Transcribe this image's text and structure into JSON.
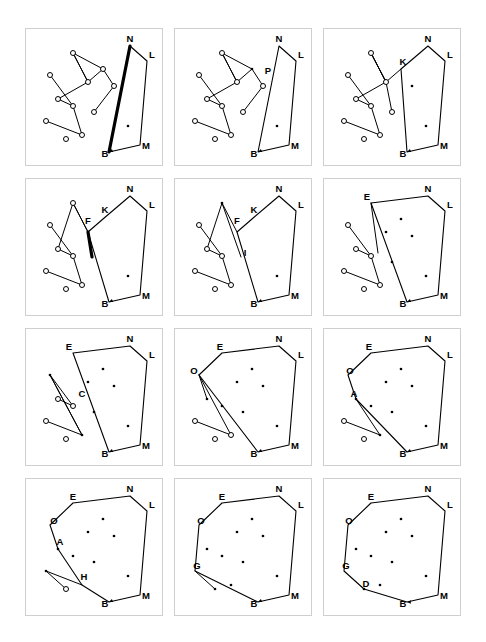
{
  "figure": {
    "panel_count": 12,
    "columns": 3,
    "rows": 4,
    "colors": {
      "stroke": "#000000",
      "panel_border": "#cfcfcf",
      "background": "#ffffff",
      "open_point_fill": "#ffffff",
      "closed_point_fill": "#000000"
    },
    "legend": {
      "open_circle_meaning": "unprocessed point",
      "filled_dot_meaning": "processed / interior point"
    }
  },
  "geometry": {
    "viewbox": "0 0 138 138",
    "hull_vertices_final": [
      {
        "label": "E",
        "x": 47,
        "y": 24
      },
      {
        "label": "N",
        "x": 104,
        "y": 17
      },
      {
        "label": "L",
        "x": 121,
        "y": 32
      },
      {
        "label": "M",
        "x": 114,
        "y": 116
      },
      {
        "label": "B",
        "x": 83,
        "y": 123
      },
      {
        "label": "D",
        "x": 40,
        "y": 110
      },
      {
        "label": "G",
        "x": 20,
        "y": 92
      },
      {
        "label": "O",
        "x": 24,
        "y": 46
      }
    ],
    "interior_points": [
      {
        "label": "I1",
        "x": 77,
        "y": 40
      },
      {
        "label": "I2",
        "x": 62,
        "y": 53
      },
      {
        "label": "I3",
        "x": 88,
        "y": 57
      },
      {
        "label": "I4",
        "x": 32,
        "y": 70
      },
      {
        "label": "I5",
        "x": 47,
        "y": 77
      },
      {
        "label": "I6",
        "x": 68,
        "y": 83
      },
      {
        "label": "I7",
        "x": 102,
        "y": 97
      },
      {
        "label": "I8",
        "x": 56,
        "y": 106
      }
    ],
    "scatter_points": [
      {
        "label": "p1",
        "x": 47,
        "y": 24
      },
      {
        "label": "p2",
        "x": 24,
        "y": 46
      },
      {
        "label": "p3",
        "x": 20,
        "y": 92
      },
      {
        "label": "p4",
        "x": 40,
        "y": 110
      },
      {
        "label": "p5",
        "x": 32,
        "y": 70
      },
      {
        "label": "p6",
        "x": 62,
        "y": 53
      },
      {
        "label": "p7",
        "x": 47,
        "y": 77
      },
      {
        "label": "p8",
        "x": 56,
        "y": 106
      },
      {
        "label": "p9",
        "x": 77,
        "y": 40
      },
      {
        "label": "p10",
        "x": 88,
        "y": 57
      },
      {
        "label": "p11",
        "x": 68,
        "y": 83
      },
      {
        "label": "p12",
        "x": 102,
        "y": 97
      },
      {
        "label": "p13",
        "x": 104,
        "y": 17
      },
      {
        "label": "p14",
        "x": 121,
        "y": 32
      },
      {
        "label": "p15",
        "x": 114,
        "y": 116
      },
      {
        "label": "p16",
        "x": 83,
        "y": 123
      }
    ]
  },
  "panels": [
    {
      "index": 1,
      "name": "step-1",
      "labels": [
        {
          "text": "N",
          "x": 104,
          "y": 13
        },
        {
          "text": "L",
          "x": 126,
          "y": 29
        },
        {
          "text": "M",
          "x": 120,
          "y": 120
        },
        {
          "text": "B",
          "x": 79,
          "y": 128
        }
      ],
      "hull_path": "M 83,123 L 104,17 L 121,32 L 114,116 Z",
      "hull_closed": true,
      "zigzag": "M 32,70 L 62,53 L 47,24 L 77,40 L 62,53",
      "chains": [
        "M 20,92 L 56,106 L 47,77",
        "M 24,46 L 47,77 L 32,70",
        "M 47,24 L 62,53",
        "M 77,40 L 88,57",
        "M 88,57 L 68,83"
      ],
      "open_points": [
        "p2",
        "p3",
        "p4",
        "p5",
        "p6",
        "p7",
        "p8",
        "p9",
        "p10",
        "p11",
        "p1"
      ],
      "closed_points": [
        "p12"
      ],
      "arrow_from": {
        "x": 90,
        "y": 120
      },
      "arrow_to": {
        "x": 83,
        "y": 123
      },
      "thick_edges": [
        "M 83,123 L 104,17"
      ]
    },
    {
      "index": 2,
      "name": "step-2",
      "labels": [
        {
          "text": "N",
          "x": 104,
          "y": 13
        },
        {
          "text": "L",
          "x": 126,
          "y": 29
        },
        {
          "text": "P",
          "x": 93,
          "y": 45
        },
        {
          "text": "M",
          "x": 120,
          "y": 120
        },
        {
          "text": "B",
          "x": 79,
          "y": 128
        }
      ],
      "hull_path": "M 83,123 L 104,17 L 121,32 L 114,116 Z",
      "hull_closed": true,
      "zigzag": "M 32,70 L 62,53 L 47,24 L 77,40 L 62,53",
      "chains": [
        "M 20,92 L 56,106 L 47,77",
        "M 24,46 L 47,77 L 32,70",
        "M 47,24 L 62,53",
        "M 77,40 L 88,57",
        "M 88,57 L 68,83"
      ],
      "open_points": [
        "p2",
        "p3",
        "p4",
        "p5",
        "p6",
        "p7",
        "p8",
        "p10",
        "p11",
        "p1"
      ],
      "closed_points": [
        "p12",
        "p9"
      ],
      "arrow_from": {
        "x": 90,
        "y": 120
      },
      "arrow_to": {
        "x": 83,
        "y": 123
      },
      "thick_edges": []
    },
    {
      "index": 3,
      "name": "step-3",
      "labels": [
        {
          "text": "N",
          "x": 104,
          "y": 13
        },
        {
          "text": "L",
          "x": 126,
          "y": 29
        },
        {
          "text": "K",
          "x": 79,
          "y": 36
        },
        {
          "text": "M",
          "x": 120,
          "y": 120
        },
        {
          "text": "B",
          "x": 79,
          "y": 128
        }
      ],
      "hull_path": "M 83,123 L 77,40 L 104,17 L 121,32 L 114,116 Z",
      "hull_closed": true,
      "zigzag": "M 32,70 L 62,53 L 47,24 L 62,53",
      "chains": [
        "M 20,92 L 56,106 L 47,77",
        "M 24,46 L 47,77 L 32,70",
        "M 47,24 L 62,53",
        "M 62,53 L 68,83",
        "M 77,40 L 62,53"
      ],
      "open_points": [
        "p2",
        "p3",
        "p4",
        "p5",
        "p6",
        "p7",
        "p8",
        "p11",
        "p1"
      ],
      "closed_points": [
        "p12",
        "p10"
      ],
      "arrow_from": {
        "x": 90,
        "y": 120
      },
      "arrow_to": {
        "x": 83,
        "y": 123
      },
      "thick_edges": []
    },
    {
      "index": 4,
      "name": "step-4",
      "labels": [
        {
          "text": "N",
          "x": 104,
          "y": 13
        },
        {
          "text": "L",
          "x": 126,
          "y": 29
        },
        {
          "text": "K",
          "x": 79,
          "y": 34
        },
        {
          "text": "F",
          "x": 62,
          "y": 45
        },
        {
          "text": "M",
          "x": 120,
          "y": 120
        },
        {
          "text": "B",
          "x": 79,
          "y": 128
        }
      ],
      "hull_path": "M 83,123 L 62,53 L 77,40 L 104,17 L 121,32 L 114,116 Z",
      "hull_closed": true,
      "zigzag": "M 32,70 L 47,24 L 62,53",
      "chains": [
        "M 20,92 L 56,106 L 47,77",
        "M 24,46 L 47,77 L 32,70",
        "M 47,24 L 62,53"
      ],
      "open_points": [
        "p2",
        "p3",
        "p4",
        "p5",
        "p7",
        "p8",
        "p1"
      ],
      "closed_points": [
        "p12"
      ],
      "arrow_from": {
        "x": 90,
        "y": 120
      },
      "arrow_to": {
        "x": 83,
        "y": 123
      },
      "thick_edges": [
        "M 62,53 L 66,78"
      ]
    },
    {
      "index": 5,
      "name": "step-5",
      "labels": [
        {
          "text": "N",
          "x": 104,
          "y": 13
        },
        {
          "text": "L",
          "x": 126,
          "y": 29
        },
        {
          "text": "K",
          "x": 79,
          "y": 34
        },
        {
          "text": "F",
          "x": 62,
          "y": 45
        },
        {
          "text": "I",
          "x": 70,
          "y": 77
        },
        {
          "text": "M",
          "x": 120,
          "y": 120
        },
        {
          "text": "B",
          "x": 79,
          "y": 128
        }
      ],
      "hull_path": "M 83,123 L 62,53 L 77,40 L 104,17 L 121,32 L 114,116 Z",
      "hull_closed": true,
      "zigzag": "M 32,70 L 47,24 L 62,53",
      "chains": [
        "M 20,92 L 56,106 L 47,77",
        "M 24,46 L 47,77 L 32,70",
        "M 47,24 L 66,78"
      ],
      "open_points": [
        "p2",
        "p3",
        "p4",
        "p5",
        "p7",
        "p8"
      ],
      "closed_points": [
        "p12",
        "p1"
      ],
      "arrow_from": {
        "x": 90,
        "y": 120
      },
      "arrow_to": {
        "x": 83,
        "y": 123
      },
      "thick_edges": []
    },
    {
      "index": 6,
      "name": "step-6",
      "labels": [
        {
          "text": "E",
          "x": 43,
          "y": 21
        },
        {
          "text": "N",
          "x": 104,
          "y": 13
        },
        {
          "text": "L",
          "x": 126,
          "y": 29
        },
        {
          "text": "M",
          "x": 120,
          "y": 120
        },
        {
          "text": "B",
          "x": 79,
          "y": 128
        }
      ],
      "hull_path": "M 83,123 L 47,24 L 104,17 L 121,32 L 114,116 Z",
      "hull_closed": true,
      "zigzag": "",
      "chains": [
        "M 20,92 L 56,106 L 47,77",
        "M 24,46 L 47,77 L 32,70",
        "M 47,24 L 54,74"
      ],
      "open_points": [
        "p2",
        "p3",
        "p4",
        "p5",
        "p7",
        "p8"
      ],
      "closed_points": [
        "p6",
        "p9",
        "p10",
        "p11",
        "p12"
      ],
      "arrow_from": {
        "x": 90,
        "y": 120
      },
      "arrow_to": {
        "x": 83,
        "y": 123
      },
      "thick_edges": []
    },
    {
      "index": 7,
      "name": "step-7",
      "labels": [
        {
          "text": "E",
          "x": 43,
          "y": 21
        },
        {
          "text": "N",
          "x": 104,
          "y": 13
        },
        {
          "text": "L",
          "x": 126,
          "y": 29
        },
        {
          "text": "C",
          "x": 56,
          "y": 68
        },
        {
          "text": "M",
          "x": 120,
          "y": 120
        },
        {
          "text": "B",
          "x": 79,
          "y": 128
        }
      ],
      "hull_path": "M 83,123 L 47,24 L 104,17 L 121,32 L 114,116 Z",
      "hull_closed": true,
      "zigzag": "",
      "chains": [
        "M 20,92 L 56,106 L 24,46",
        "M 24,46 L 47,77 L 32,70",
        "M 24,46 L 56,106"
      ],
      "open_points": [
        "p3",
        "p4",
        "p5",
        "p7"
      ],
      "closed_points": [
        "p2",
        "p6",
        "p9",
        "p10",
        "p11",
        "p12",
        "p8"
      ],
      "arrow_from": {
        "x": 90,
        "y": 120
      },
      "arrow_to": {
        "x": 83,
        "y": 123
      },
      "thick_edges": []
    },
    {
      "index": 8,
      "name": "step-8",
      "labels": [
        {
          "text": "E",
          "x": 45,
          "y": 21
        },
        {
          "text": "N",
          "x": 104,
          "y": 13
        },
        {
          "text": "L",
          "x": 126,
          "y": 29
        },
        {
          "text": "O",
          "x": 19,
          "y": 45
        },
        {
          "text": "M",
          "x": 120,
          "y": 120
        },
        {
          "text": "B",
          "x": 79,
          "y": 128
        }
      ],
      "hull_path": "M 83,123 L 24,46 L 47,24 L 104,17 L 121,32 L 114,116 Z",
      "hull_closed": true,
      "zigzag": "",
      "chains": [
        "M 20,92 L 56,106 L 24,46",
        "M 24,46 L 32,70"
      ],
      "open_points": [
        "p3",
        "p4",
        "p8"
      ],
      "closed_points": [
        "p5",
        "p6",
        "p7",
        "p9",
        "p10",
        "p11",
        "p12"
      ],
      "arrow_from": {
        "x": 90,
        "y": 120
      },
      "arrow_to": {
        "x": 83,
        "y": 123
      },
      "thick_edges": []
    },
    {
      "index": 9,
      "name": "step-9",
      "labels": [
        {
          "text": "E",
          "x": 45,
          "y": 21
        },
        {
          "text": "N",
          "x": 104,
          "y": 13
        },
        {
          "text": "L",
          "x": 126,
          "y": 29
        },
        {
          "text": "O",
          "x": 26,
          "y": 45
        },
        {
          "text": "A",
          "x": 30,
          "y": 68
        },
        {
          "text": "M",
          "x": 120,
          "y": 120
        },
        {
          "text": "B",
          "x": 79,
          "y": 128
        }
      ],
      "hull_path": "M 83,123 L 32,70 L 24,46 L 47,24 L 104,17 L 121,32 L 114,116 Z",
      "hull_closed": true,
      "zigzag": "",
      "chains": [
        "M 20,92 L 56,106 L 32,70"
      ],
      "open_points": [
        "p3",
        "p4"
      ],
      "closed_points": [
        "p5",
        "p6",
        "p7",
        "p8",
        "p9",
        "p10",
        "p11",
        "p12"
      ],
      "arrow_from": {
        "x": 90,
        "y": 120
      },
      "arrow_to": {
        "x": 83,
        "y": 123
      },
      "thick_edges": []
    },
    {
      "index": 10,
      "name": "step-10",
      "labels": [
        {
          "text": "E",
          "x": 47,
          "y": 21
        },
        {
          "text": "N",
          "x": 104,
          "y": 13
        },
        {
          "text": "L",
          "x": 126,
          "y": 29
        },
        {
          "text": "O",
          "x": 28,
          "y": 45
        },
        {
          "text": "A",
          "x": 34,
          "y": 66
        },
        {
          "text": "H",
          "x": 58,
          "y": 101
        },
        {
          "text": "M",
          "x": 120,
          "y": 120
        },
        {
          "text": "B",
          "x": 79,
          "y": 128
        }
      ],
      "hull_path": "M 83,123 L 56,106 L 32,70 L 24,46 L 47,24 L 104,17 L 121,32 L 114,116 Z",
      "hull_closed": true,
      "zigzag": "",
      "chains": [
        "M 20,92 L 56,106",
        "M 20,92 L 40,110"
      ],
      "open_points": [
        "p4"
      ],
      "closed_points": [
        "p3",
        "p5",
        "p6",
        "p7",
        "p9",
        "p10",
        "p11",
        "p12"
      ],
      "arrow_from": {
        "x": 90,
        "y": 120
      },
      "arrow_to": {
        "x": 83,
        "y": 123
      },
      "thick_edges": []
    },
    {
      "index": 11,
      "name": "step-11",
      "labels": [
        {
          "text": "E",
          "x": 47,
          "y": 21
        },
        {
          "text": "N",
          "x": 104,
          "y": 13
        },
        {
          "text": "L",
          "x": 126,
          "y": 29
        },
        {
          "text": "O",
          "x": 26,
          "y": 45
        },
        {
          "text": "G",
          "x": 22,
          "y": 90
        },
        {
          "text": "M",
          "x": 120,
          "y": 120
        },
        {
          "text": "B",
          "x": 79,
          "y": 128
        }
      ],
      "hull_path": "M 83,123 L 20,92 L 24,46 L 47,24 L 104,17 L 121,32 L 114,116 Z",
      "hull_closed": true,
      "zigzag": "",
      "chains": [
        "M 20,92 L 40,110"
      ],
      "open_points": [],
      "closed_points": [
        "p4",
        "p5",
        "p6",
        "p7",
        "p8",
        "p9",
        "p10",
        "p11",
        "p12"
      ],
      "arrow_from": {
        "x": 90,
        "y": 120
      },
      "arrow_to": {
        "x": 83,
        "y": 123
      },
      "thick_edges": []
    },
    {
      "index": 12,
      "name": "step-12-final",
      "labels": [
        {
          "text": "E",
          "x": 47,
          "y": 21
        },
        {
          "text": "N",
          "x": 104,
          "y": 13
        },
        {
          "text": "L",
          "x": 126,
          "y": 29
        },
        {
          "text": "O",
          "x": 25,
          "y": 45
        },
        {
          "text": "G",
          "x": 22,
          "y": 90
        },
        {
          "text": "D",
          "x": 42,
          "y": 108
        },
        {
          "text": "M",
          "x": 120,
          "y": 120
        },
        {
          "text": "B",
          "x": 79,
          "y": 128
        }
      ],
      "hull_path": "M 83,123 L 40,110 L 20,92 L 24,46 L 47,24 L 104,17 L 121,32 L 114,116 Z",
      "hull_closed": true,
      "zigzag": "",
      "chains": [],
      "open_points": [],
      "closed_points": [
        "p4",
        "p5",
        "p6",
        "p7",
        "p8",
        "p9",
        "p10",
        "p11",
        "p12"
      ],
      "arrow_from": {
        "x": 90,
        "y": 123
      },
      "arrow_to": {
        "x": 83,
        "y": 123
      },
      "thick_edges": []
    }
  ]
}
